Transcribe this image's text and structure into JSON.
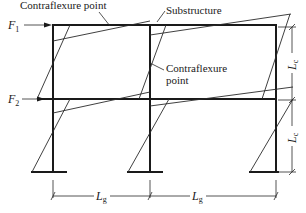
{
  "diagram": {
    "type": "structural-frame-moment-diagram",
    "labels": {
      "contraflexure_top": "Contraflexure point",
      "substructure": "Substructure",
      "contraflexure_mid_line1": "Contraflexure",
      "contraflexure_mid_line2": "point"
    },
    "forces": [
      {
        "symbol": "F",
        "subscript": "1"
      },
      {
        "symbol": "F",
        "subscript": "2"
      }
    ],
    "dimensions": {
      "column_height_symbol": "L",
      "column_height_subscript": "c",
      "beam_length_symbol": "L",
      "beam_length_subscript": "g"
    },
    "structure": {
      "stories": 2,
      "bays": 2,
      "columns": 3,
      "colors": {
        "line": "#1a1a1a",
        "background": "#ffffff"
      }
    }
  }
}
